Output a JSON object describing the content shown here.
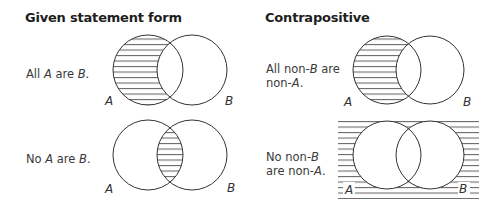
{
  "columns": {
    "given": {
      "heading": "Given statement form"
    },
    "contrapositive": {
      "heading": "Contrapositive"
    }
  },
  "rows": [
    {
      "given": {
        "statement_parts": [
          "All ",
          "A",
          " are ",
          "B",
          "."
        ],
        "diagram": {
          "set_a_label": "A",
          "set_b_label": "B",
          "shaded_region": "A only (A minus B)"
        }
      },
      "contrapositive": {
        "statement_line1_parts": [
          "All non-",
          "B",
          " are"
        ],
        "statement_line2_parts": [
          "non-",
          "A",
          "."
        ],
        "diagram": {
          "set_a_label": "A",
          "set_b_label": "B",
          "shaded_region": "A only (A minus B)"
        }
      }
    },
    {
      "given": {
        "statement_parts": [
          "No ",
          "A",
          " are ",
          "B",
          "."
        ],
        "diagram": {
          "set_a_label": "A",
          "set_b_label": "B",
          "shaded_region": "A and B intersection"
        }
      },
      "contrapositive": {
        "statement_line1_parts": [
          "No non-",
          "B"
        ],
        "statement_line2_parts": [
          "are non-",
          "A",
          "."
        ],
        "diagram": {
          "set_a_label": "A",
          "set_b_label": "B",
          "shaded_region": "outside A and B (universe minus A union B)"
        }
      }
    }
  ],
  "colors": {
    "stroke": "#333333",
    "hatch": "#444444",
    "text": "#3a3a3a"
  }
}
